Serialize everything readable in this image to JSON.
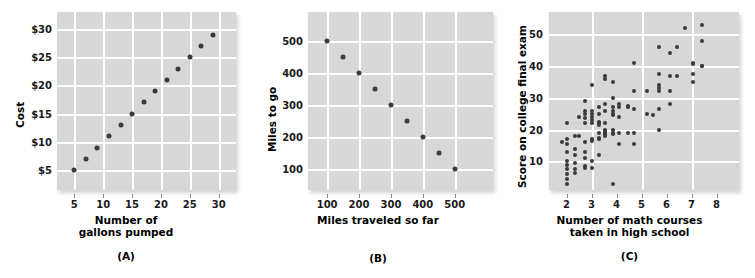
{
  "figure": {
    "background": "#ffffff",
    "plot_background": "#d7d7d7",
    "gridline_color": "#ffffff",
    "marker_color": "#3a3a3a"
  },
  "chart_data": [
    {
      "type": "scatter",
      "panel": "A",
      "caption": "(A)",
      "title": "",
      "xlabel_line1": "Number of",
      "xlabel_line2": "gallons pumped",
      "ylabel": "Cost",
      "xticks": [
        "5",
        "10",
        "15",
        "20",
        "25",
        "30"
      ],
      "xtick_values": [
        5,
        10,
        15,
        20,
        25,
        30
      ],
      "yticks": [
        "$5",
        "$10",
        "$15",
        "$20",
        "$25",
        "$30"
      ],
      "ytick_values": [
        5,
        10,
        15,
        20,
        25,
        30
      ],
      "xlim": [
        2,
        33
      ],
      "ylim": [
        1.5,
        33
      ],
      "grid": true,
      "x": [
        5,
        7,
        9,
        11,
        13,
        15,
        17,
        19,
        21,
        23,
        25,
        27,
        29
      ],
      "y": [
        5,
        7,
        9,
        11,
        13,
        15,
        17,
        19,
        21,
        23,
        25,
        27,
        29
      ],
      "relationship": "perfect positive linear"
    },
    {
      "type": "scatter",
      "panel": "B",
      "caption": "(B)",
      "title": "",
      "xlabel_line1": "Miles traveled so far",
      "xlabel_line2": "",
      "ylabel": "Miles to go",
      "xticks": [
        "100",
        "200",
        "300",
        "400",
        "500"
      ],
      "xtick_values": [
        100,
        200,
        300,
        400,
        500
      ],
      "yticks": [
        "100",
        "200",
        "300",
        "400",
        "500"
      ],
      "ytick_values": [
        100,
        200,
        300,
        400,
        500
      ],
      "xlim": [
        40,
        620
      ],
      "ylim": [
        35,
        590
      ],
      "grid": true,
      "x": [
        100,
        150,
        200,
        250,
        300,
        350,
        400,
        450,
        500
      ],
      "y": [
        500,
        450,
        400,
        350,
        300,
        250,
        200,
        150,
        100
      ],
      "relationship": "perfect negative linear"
    },
    {
      "type": "scatter",
      "panel": "C",
      "caption": "(C)",
      "title": "",
      "xlabel_line1": "Number of math courses",
      "xlabel_line2": "taken in high school",
      "ylabel": "Score on college final exam",
      "xticks": [
        "2",
        "3",
        "4",
        "5",
        "6",
        "7",
        "8"
      ],
      "xtick_values": [
        2,
        3,
        4,
        5,
        6,
        7,
        8
      ],
      "yticks": [
        "10",
        "20",
        "30",
        "40",
        "50"
      ],
      "ytick_values": [
        10,
        20,
        30,
        40,
        50
      ],
      "xlim": [
        1.3,
        8.9
      ],
      "ylim": [
        1,
        57
      ],
      "grid": true,
      "points": [
        [
          1.8,
          16
        ],
        [
          2.0,
          22
        ],
        [
          2.0,
          17
        ],
        [
          2.0,
          15.5
        ],
        [
          2.0,
          13
        ],
        [
          2.0,
          10
        ],
        [
          2.0,
          9
        ],
        [
          2.0,
          7.5
        ],
        [
          2.0,
          6
        ],
        [
          2.0,
          4.5
        ],
        [
          2.0,
          3
        ],
        [
          2.35,
          18
        ],
        [
          2.35,
          14
        ],
        [
          2.35,
          12
        ],
        [
          2.35,
          9.5
        ],
        [
          2.35,
          7.5
        ],
        [
          2.35,
          6.5
        ],
        [
          2.5,
          24
        ],
        [
          2.5,
          18
        ],
        [
          2.75,
          29
        ],
        [
          2.75,
          26
        ],
        [
          2.75,
          25
        ],
        [
          2.75,
          23.5
        ],
        [
          2.75,
          22
        ],
        [
          2.75,
          16
        ],
        [
          2.75,
          13
        ],
        [
          2.75,
          11
        ],
        [
          2.75,
          8.5
        ],
        [
          2.75,
          8
        ],
        [
          3.0,
          34
        ],
        [
          3.0,
          26
        ],
        [
          3.0,
          25
        ],
        [
          3.0,
          24
        ],
        [
          3.0,
          23
        ],
        [
          3.0,
          22
        ],
        [
          3.0,
          17
        ],
        [
          3.0,
          16.5
        ],
        [
          3.0,
          10
        ],
        [
          3.0,
          8
        ],
        [
          3.3,
          27
        ],
        [
          3.3,
          25
        ],
        [
          3.3,
          22.5
        ],
        [
          3.3,
          22
        ],
        [
          3.3,
          21.5
        ],
        [
          3.3,
          19
        ],
        [
          3.3,
          17.5
        ],
        [
          3.3,
          17
        ],
        [
          3.3,
          12
        ],
        [
          3.55,
          37
        ],
        [
          3.55,
          36
        ],
        [
          3.55,
          28
        ],
        [
          3.55,
          26
        ],
        [
          3.55,
          22
        ],
        [
          3.55,
          20
        ],
        [
          3.55,
          19.5
        ],
        [
          3.55,
          19
        ],
        [
          3.55,
          18.5
        ],
        [
          3.55,
          18
        ],
        [
          3.85,
          35
        ],
        [
          3.85,
          30
        ],
        [
          3.85,
          27
        ],
        [
          3.85,
          26
        ],
        [
          3.85,
          25
        ],
        [
          3.85,
          24.5
        ],
        [
          3.85,
          20
        ],
        [
          3.85,
          19
        ],
        [
          3.85,
          18.5
        ],
        [
          3.85,
          3
        ],
        [
          4.1,
          28
        ],
        [
          4.1,
          27
        ],
        [
          4.1,
          24
        ],
        [
          4.1,
          19
        ],
        [
          4.1,
          15.5
        ],
        [
          4.45,
          27.5
        ],
        [
          4.45,
          27
        ],
        [
          4.45,
          19
        ],
        [
          4.7,
          41
        ],
        [
          4.7,
          32
        ],
        [
          4.7,
          26.5
        ],
        [
          4.7,
          19
        ],
        [
          4.7,
          15.5
        ],
        [
          5.2,
          32
        ],
        [
          5.2,
          25
        ],
        [
          5.45,
          24.5
        ],
        [
          5.7,
          46
        ],
        [
          5.7,
          37.5
        ],
        [
          5.7,
          34
        ],
        [
          5.7,
          33
        ],
        [
          5.7,
          32
        ],
        [
          5.7,
          26.5
        ],
        [
          5.7,
          20
        ],
        [
          6.15,
          44
        ],
        [
          6.15,
          37
        ],
        [
          6.15,
          32
        ],
        [
          6.15,
          28
        ],
        [
          6.4,
          46
        ],
        [
          6.4,
          37
        ],
        [
          6.75,
          52
        ],
        [
          7.05,
          41
        ],
        [
          7.05,
          40.5
        ],
        [
          7.05,
          37.5
        ],
        [
          7.05,
          35
        ],
        [
          7.4,
          53
        ],
        [
          7.4,
          48
        ],
        [
          7.4,
          40
        ],
        [
          7.4,
          40
        ]
      ],
      "relationship": "moderate positive, scattered"
    }
  ]
}
